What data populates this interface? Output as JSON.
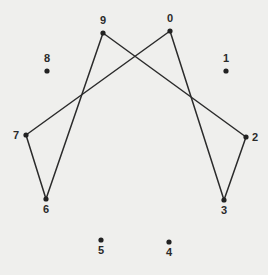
{
  "diagram": {
    "title": "",
    "background": "#efefed",
    "line_color": "#2b2b2b",
    "points": [
      {
        "id": "0",
        "label": "0",
        "x": 170,
        "y": 31,
        "lx": 170,
        "ly": 22,
        "anchor": "middle"
      },
      {
        "id": "1",
        "label": "1",
        "x": 226,
        "y": 71,
        "lx": 226,
        "ly": 62,
        "anchor": "middle"
      },
      {
        "id": "2",
        "label": "2",
        "x": 246,
        "y": 137,
        "lx": 252,
        "ly": 141,
        "anchor": "start"
      },
      {
        "id": "3",
        "label": "3",
        "x": 224,
        "y": 200,
        "lx": 224,
        "ly": 214,
        "anchor": "middle"
      },
      {
        "id": "4",
        "label": "4",
        "x": 169,
        "y": 242,
        "lx": 169,
        "ly": 256,
        "anchor": "middle"
      },
      {
        "id": "5",
        "label": "5",
        "x": 101,
        "y": 240,
        "lx": 101,
        "ly": 254,
        "anchor": "middle"
      },
      {
        "id": "6",
        "label": "6",
        "x": 46,
        "y": 199,
        "lx": 46,
        "ly": 213,
        "anchor": "middle"
      },
      {
        "id": "7",
        "label": "7",
        "x": 26,
        "y": 135,
        "lx": 19,
        "ly": 139,
        "anchor": "end"
      },
      {
        "id": "8",
        "label": "8",
        "x": 47,
        "y": 71,
        "lx": 47,
        "ly": 62,
        "anchor": "middle"
      },
      {
        "id": "9",
        "label": "9",
        "x": 103,
        "y": 33,
        "lx": 103,
        "ly": 24,
        "anchor": "middle"
      }
    ],
    "edges": [
      {
        "from": "0",
        "to": "7"
      },
      {
        "from": "7",
        "to": "6"
      },
      {
        "from": "6",
        "to": "9"
      },
      {
        "from": "9",
        "to": "2"
      },
      {
        "from": "2",
        "to": "3"
      },
      {
        "from": "3",
        "to": "0"
      }
    ]
  }
}
